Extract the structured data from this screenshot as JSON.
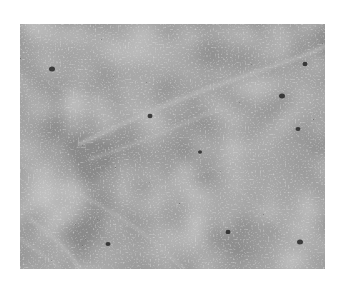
{
  "image": {
    "kind": "grayscale histology micrograph",
    "description": "Densely cellular tissue section with numerous dark nuclei and lighter stromal strands",
    "colors": {
      "page_background": "#ffffff",
      "tissue_base": "#8c8c8c",
      "nuclei": "#2a2a2a",
      "stroma": "#b4b4b4"
    },
    "frame": {
      "x": 20,
      "y": 24,
      "width": 305,
      "height": 245
    }
  }
}
